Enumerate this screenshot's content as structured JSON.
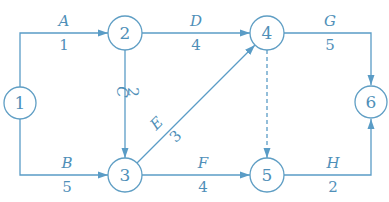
{
  "diagram": {
    "type": "activity-on-arrow network",
    "color": "#5a9cc6",
    "nodes": [
      {
        "id": "1",
        "label": "1"
      },
      {
        "id": "2",
        "label": "2"
      },
      {
        "id": "3",
        "label": "3"
      },
      {
        "id": "4",
        "label": "4"
      },
      {
        "id": "5",
        "label": "5"
      },
      {
        "id": "6",
        "label": "6"
      }
    ],
    "edges": [
      {
        "from": "1",
        "to": "2",
        "activity": "A",
        "duration": "1"
      },
      {
        "from": "1",
        "to": "3",
        "activity": "B",
        "duration": "5"
      },
      {
        "from": "2",
        "to": "3",
        "activity": "C",
        "duration": "2"
      },
      {
        "from": "2",
        "to": "4",
        "activity": "D",
        "duration": "4"
      },
      {
        "from": "3",
        "to": "4",
        "activity": "E",
        "duration": "3"
      },
      {
        "from": "3",
        "to": "5",
        "activity": "F",
        "duration": "4"
      },
      {
        "from": "4",
        "to": "6",
        "activity": "G",
        "duration": "5"
      },
      {
        "from": "5",
        "to": "6",
        "activity": "H",
        "duration": "2"
      },
      {
        "from": "4",
        "to": "5",
        "activity": "dummy",
        "duration": "",
        "style": "dashed"
      }
    ]
  }
}
